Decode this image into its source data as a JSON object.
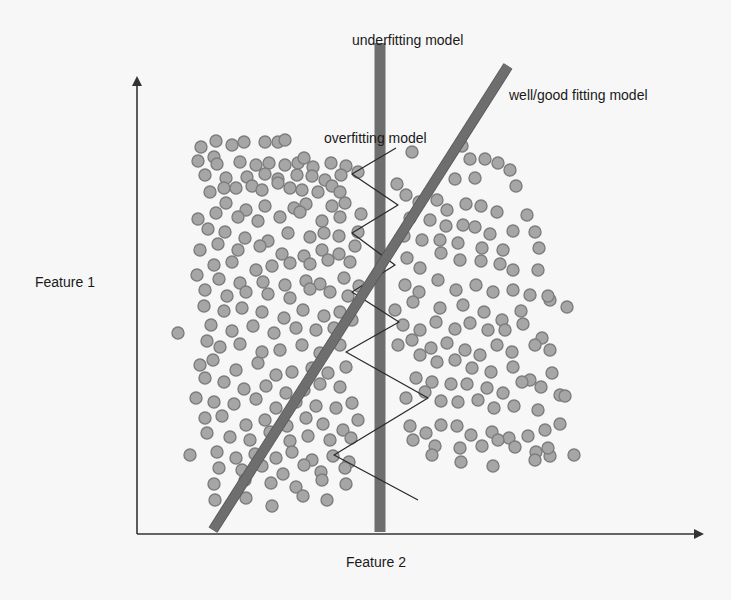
{
  "labels": {
    "underfitting": "underfitting model",
    "good_fitting": "well/good fitting model",
    "overfitting": "overfitting model",
    "y_axis": "Feature 1",
    "x_axis": "Feature 2"
  },
  "colors": {
    "background": "#f7f7f7",
    "axis": "#333333",
    "model_bar": "#6e6e6e",
    "model_bar_edge": "#555555",
    "dot_fill": "#a6a6a6",
    "dot_stroke": "#7d7d7d",
    "zigzag": "#2a2a2a"
  },
  "axes": {
    "origin": [
      137,
      534
    ],
    "y_top": 78,
    "x_right": 702
  },
  "models": {
    "underfitting": {
      "x1": 380,
      "y1": 43,
      "x2": 380,
      "y2": 532,
      "width": 11
    },
    "good_fitting": {
      "x1": 213,
      "y1": 530,
      "x2": 508,
      "y2": 66,
      "width": 9
    },
    "overfitting": {
      "points": [
        [
          396,
          148
        ],
        [
          352,
          174
        ],
        [
          398,
          205
        ],
        [
          352,
          233
        ],
        [
          395,
          265
        ],
        [
          352,
          292
        ],
        [
          399,
          322
        ],
        [
          346,
          352
        ],
        [
          428,
          398
        ],
        [
          334,
          455
        ],
        [
          418,
          500
        ]
      ]
    }
  },
  "dots": [
    [
      201,
      147
    ],
    [
      216,
      141
    ],
    [
      214,
      157
    ],
    [
      232,
      145
    ],
    [
      244,
      142
    ],
    [
      265,
      142
    ],
    [
      278,
      142
    ],
    [
      285,
      140
    ],
    [
      198,
      161
    ],
    [
      217,
      164
    ],
    [
      240,
      162
    ],
    [
      256,
      165
    ],
    [
      269,
      163
    ],
    [
      285,
      165
    ],
    [
      298,
      163
    ],
    [
      313,
      167
    ],
    [
      304,
      158
    ],
    [
      331,
      163
    ],
    [
      346,
      166
    ],
    [
      205,
      175
    ],
    [
      226,
      178
    ],
    [
      247,
      177
    ],
    [
      265,
      174
    ],
    [
      278,
      179
    ],
    [
      297,
      175
    ],
    [
      312,
      176
    ],
    [
      325,
      180
    ],
    [
      341,
      175
    ],
    [
      358,
      172
    ],
    [
      210,
      192
    ],
    [
      224,
      188
    ],
    [
      236,
      188
    ],
    [
      252,
      186
    ],
    [
      262,
      190
    ],
    [
      278,
      183
    ],
    [
      290,
      188
    ],
    [
      302,
      190
    ],
    [
      318,
      192
    ],
    [
      332,
      186
    ],
    [
      340,
      192
    ],
    [
      226,
      203
    ],
    [
      246,
      210
    ],
    [
      265,
      206
    ],
    [
      294,
      208
    ],
    [
      306,
      204
    ],
    [
      332,
      206
    ],
    [
      345,
      203
    ],
    [
      198,
      219
    ],
    [
      216,
      213
    ],
    [
      238,
      217
    ],
    [
      258,
      221
    ],
    [
      280,
      217
    ],
    [
      300,
      212
    ],
    [
      322,
      221
    ],
    [
      340,
      217
    ],
    [
      361,
      214
    ],
    [
      208,
      229
    ],
    [
      225,
      232
    ],
    [
      245,
      238
    ],
    [
      268,
      241
    ],
    [
      288,
      233
    ],
    [
      310,
      237
    ],
    [
      324,
      233
    ],
    [
      339,
      236
    ],
    [
      358,
      232
    ],
    [
      200,
      250
    ],
    [
      218,
      244
    ],
    [
      238,
      250
    ],
    [
      260,
      246
    ],
    [
      282,
      254
    ],
    [
      304,
      256
    ],
    [
      322,
      250
    ],
    [
      339,
      254
    ],
    [
      355,
      246
    ],
    [
      214,
      265
    ],
    [
      232,
      262
    ],
    [
      256,
      270
    ],
    [
      272,
      266
    ],
    [
      290,
      263
    ],
    [
      310,
      264
    ],
    [
      328,
      260
    ],
    [
      350,
      262
    ],
    [
      197,
      275
    ],
    [
      219,
      279
    ],
    [
      240,
      283
    ],
    [
      263,
      282
    ],
    [
      285,
      285
    ],
    [
      306,
      281
    ],
    [
      320,
      284
    ],
    [
      344,
      278
    ],
    [
      359,
      286
    ],
    [
      205,
      290
    ],
    [
      227,
      296
    ],
    [
      246,
      292
    ],
    [
      268,
      294
    ],
    [
      290,
      298
    ],
    [
      310,
      289
    ],
    [
      330,
      292
    ],
    [
      348,
      296
    ],
    [
      178,
      333
    ],
    [
      204,
      306
    ],
    [
      224,
      311
    ],
    [
      242,
      308
    ],
    [
      262,
      312
    ],
    [
      284,
      318
    ],
    [
      303,
      310
    ],
    [
      324,
      316
    ],
    [
      340,
      312
    ],
    [
      211,
      325
    ],
    [
      232,
      331
    ],
    [
      253,
      326
    ],
    [
      274,
      333
    ],
    [
      296,
      328
    ],
    [
      316,
      330
    ],
    [
      334,
      328
    ],
    [
      352,
      320
    ],
    [
      207,
      341
    ],
    [
      220,
      347
    ],
    [
      240,
      344
    ],
    [
      262,
      352
    ],
    [
      280,
      350
    ],
    [
      302,
      345
    ],
    [
      320,
      353
    ],
    [
      340,
      345
    ],
    [
      200,
      365
    ],
    [
      213,
      360
    ],
    [
      236,
      370
    ],
    [
      258,
      363
    ],
    [
      276,
      375
    ],
    [
      292,
      372
    ],
    [
      312,
      368
    ],
    [
      328,
      373
    ],
    [
      346,
      367
    ],
    [
      205,
      378
    ],
    [
      224,
      382
    ],
    [
      244,
      389
    ],
    [
      266,
      386
    ],
    [
      286,
      393
    ],
    [
      304,
      390
    ],
    [
      320,
      384
    ],
    [
      340,
      387
    ],
    [
      196,
      398
    ],
    [
      214,
      402
    ],
    [
      234,
      404
    ],
    [
      256,
      399
    ],
    [
      276,
      408
    ],
    [
      296,
      402
    ],
    [
      316,
      406
    ],
    [
      336,
      408
    ],
    [
      352,
      403
    ],
    [
      205,
      418
    ],
    [
      222,
      416
    ],
    [
      246,
      425
    ],
    [
      265,
      420
    ],
    [
      287,
      426
    ],
    [
      306,
      418
    ],
    [
      323,
      424
    ],
    [
      343,
      430
    ],
    [
      358,
      420
    ],
    [
      207,
      433
    ],
    [
      230,
      437
    ],
    [
      250,
      440
    ],
    [
      270,
      432
    ],
    [
      290,
      441
    ],
    [
      308,
      436
    ],
    [
      330,
      440
    ],
    [
      351,
      438
    ],
    [
      190,
      455
    ],
    [
      217,
      452
    ],
    [
      236,
      458
    ],
    [
      255,
      454
    ],
    [
      276,
      458
    ],
    [
      292,
      452
    ],
    [
      312,
      460
    ],
    [
      333,
      456
    ],
    [
      349,
      462
    ],
    [
      219,
      468
    ],
    [
      242,
      470
    ],
    [
      262,
      466
    ],
    [
      283,
      474
    ],
    [
      304,
      465
    ],
    [
      321,
      472
    ],
    [
      345,
      468
    ],
    [
      214,
      484
    ],
    [
      245,
      480
    ],
    [
      271,
      483
    ],
    [
      296,
      487
    ],
    [
      322,
      480
    ],
    [
      346,
      484
    ],
    [
      215,
      500
    ],
    [
      246,
      498
    ],
    [
      272,
      506
    ],
    [
      303,
      496
    ],
    [
      327,
      500
    ],
    [
      412,
      152
    ],
    [
      462,
      146
    ],
    [
      470,
      159
    ],
    [
      485,
      159
    ],
    [
      498,
      163
    ],
    [
      510,
      170
    ],
    [
      455,
      179
    ],
    [
      475,
      178
    ],
    [
      516,
      186
    ],
    [
      397,
      184
    ],
    [
      406,
      195
    ],
    [
      419,
      202
    ],
    [
      437,
      200
    ],
    [
      447,
      210
    ],
    [
      466,
      204
    ],
    [
      481,
      206
    ],
    [
      497,
      212
    ],
    [
      527,
      215
    ],
    [
      410,
      218
    ],
    [
      430,
      220
    ],
    [
      446,
      226
    ],
    [
      463,
      225
    ],
    [
      475,
      227
    ],
    [
      490,
      234
    ],
    [
      513,
      231
    ],
    [
      535,
      232
    ],
    [
      404,
      236
    ],
    [
      422,
      240
    ],
    [
      440,
      240
    ],
    [
      458,
      243
    ],
    [
      482,
      248
    ],
    [
      503,
      250
    ],
    [
      539,
      248
    ],
    [
      407,
      258
    ],
    [
      420,
      268
    ],
    [
      441,
      253
    ],
    [
      460,
      260
    ],
    [
      481,
      261
    ],
    [
      500,
      264
    ],
    [
      513,
      270
    ],
    [
      538,
      270
    ],
    [
      405,
      285
    ],
    [
      419,
      292
    ],
    [
      438,
      280
    ],
    [
      456,
      290
    ],
    [
      476,
      285
    ],
    [
      493,
      292
    ],
    [
      513,
      290
    ],
    [
      530,
      295
    ],
    [
      550,
      300
    ],
    [
      395,
      310
    ],
    [
      413,
      302
    ],
    [
      440,
      308
    ],
    [
      463,
      305
    ],
    [
      484,
      312
    ],
    [
      502,
      320
    ],
    [
      521,
      311
    ],
    [
      548,
      296
    ],
    [
      567,
      307
    ],
    [
      403,
      325
    ],
    [
      420,
      330
    ],
    [
      436,
      322
    ],
    [
      455,
      329
    ],
    [
      470,
      323
    ],
    [
      488,
      330
    ],
    [
      505,
      330
    ],
    [
      523,
      324
    ],
    [
      542,
      338
    ],
    [
      398,
      345
    ],
    [
      412,
      340
    ],
    [
      431,
      348
    ],
    [
      447,
      343
    ],
    [
      465,
      350
    ],
    [
      480,
      355
    ],
    [
      497,
      345
    ],
    [
      512,
      352
    ],
    [
      535,
      345
    ],
    [
      550,
      350
    ],
    [
      420,
      355
    ],
    [
      437,
      362
    ],
    [
      455,
      360
    ],
    [
      472,
      368
    ],
    [
      491,
      372
    ],
    [
      513,
      367
    ],
    [
      530,
      380
    ],
    [
      552,
      373
    ],
    [
      416,
      378
    ],
    [
      432,
      382
    ],
    [
      451,
      384
    ],
    [
      467,
      384
    ],
    [
      487,
      388
    ],
    [
      503,
      393
    ],
    [
      522,
      382
    ],
    [
      541,
      387
    ],
    [
      560,
      395
    ],
    [
      406,
      398
    ],
    [
      425,
      392
    ],
    [
      441,
      401
    ],
    [
      458,
      402
    ],
    [
      478,
      400
    ],
    [
      494,
      408
    ],
    [
      514,
      406
    ],
    [
      538,
      410
    ],
    [
      565,
      396
    ],
    [
      410,
      426
    ],
    [
      426,
      433
    ],
    [
      441,
      425
    ],
    [
      457,
      426
    ],
    [
      471,
      435
    ],
    [
      492,
      432
    ],
    [
      509,
      438
    ],
    [
      528,
      436
    ],
    [
      545,
      430
    ],
    [
      560,
      424
    ],
    [
      413,
      440
    ],
    [
      435,
      446
    ],
    [
      460,
      448
    ],
    [
      482,
      446
    ],
    [
      498,
      440
    ],
    [
      515,
      447
    ],
    [
      536,
      452
    ],
    [
      550,
      456
    ],
    [
      574,
      455
    ],
    [
      432,
      455
    ],
    [
      461,
      462
    ],
    [
      493,
      466
    ],
    [
      535,
      460
    ],
    [
      548,
      448
    ]
  ],
  "dot_radius": 6
}
